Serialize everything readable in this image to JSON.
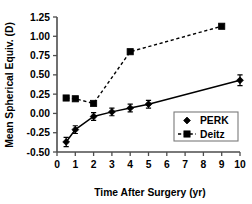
{
  "chart_data": {
    "type": "line",
    "title": "",
    "xlabel": "Time After Surgery (yr)",
    "ylabel": "Mean Spherical Equiv. (D)",
    "xlim": [
      0,
      10
    ],
    "ylim": [
      -0.5,
      1.25
    ],
    "xticks": [
      0,
      1,
      2,
      3,
      4,
      5,
      6,
      7,
      8,
      9,
      10
    ],
    "xticklabels": [
      "0",
      "1",
      "2",
      "3",
      "4",
      "5",
      "6",
      "7",
      "8",
      "9",
      "10"
    ],
    "yticks": [
      -0.5,
      -0.25,
      0.0,
      0.25,
      0.5,
      0.75,
      1.0,
      1.25
    ],
    "yticklabels": [
      "-0.50",
      "-0.25",
      "0.00",
      "0.25",
      "0.50",
      "0.75",
      "1.00",
      "1.25"
    ],
    "grid": false,
    "legend_position": "lower right",
    "series": [
      {
        "name": "PERK",
        "marker": "diamond",
        "linestyle": "solid",
        "color": "#000000",
        "x": [
          0.5,
          1.0,
          2.0,
          3.0,
          4.0,
          5.0,
          10.0
        ],
        "values": [
          -0.37,
          -0.21,
          -0.04,
          0.02,
          0.07,
          0.12,
          0.43
        ],
        "yerr": [
          0.06,
          0.05,
          0.05,
          0.05,
          0.05,
          0.05,
          0.07
        ]
      },
      {
        "name": "Deitz",
        "marker": "square",
        "linestyle": "dashed",
        "color": "#000000",
        "x": [
          0.5,
          1.0,
          2.0,
          4.0,
          9.0
        ],
        "values": [
          0.2,
          0.19,
          0.13,
          0.8,
          1.13
        ],
        "yerr": [
          0,
          0,
          0,
          0,
          0
        ]
      }
    ],
    "legend": [
      {
        "label": "PERK",
        "marker": "diamond",
        "linestyle": "solid"
      },
      {
        "label": "Deitz",
        "marker": "square",
        "linestyle": "dashed"
      }
    ],
    "colors": {
      "axis": "#4d4d4d",
      "series_perk": "#000000",
      "series_deitz": "#000000",
      "background": "#ffffff",
      "legend_border": "#7a7a7a"
    }
  }
}
